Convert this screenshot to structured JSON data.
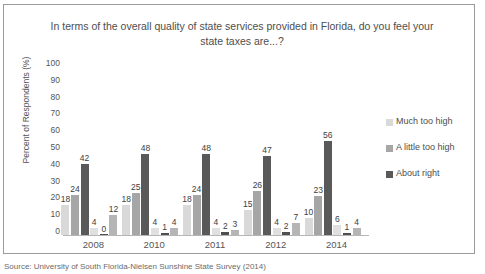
{
  "chart_data": {
    "type": "bar",
    "title": "In terms of the overall quality of state services provided in Florida, do you feel your state taxes are...?",
    "xlabel": "",
    "ylabel": "Percent of Respondents (%)",
    "ylim": [
      0,
      100
    ],
    "ytick_labels": [
      "100",
      "90",
      "80",
      "70",
      "60",
      "50",
      "40",
      "30",
      "20",
      "10",
      "0"
    ],
    "grid": false,
    "legend_position": "right",
    "categories": [
      "2008",
      "2010",
      "2011",
      "2012",
      "2014"
    ],
    "series": [
      {
        "name": "Much too high",
        "color": "#d9d9d9",
        "values": [
          18,
          18,
          18,
          15,
          10
        ]
      },
      {
        "name": "A little too high",
        "color": "#a6a6a6",
        "values": [
          24,
          25,
          24,
          26,
          23
        ]
      },
      {
        "name": "About right",
        "color": "#595959",
        "values": [
          42,
          48,
          48,
          47,
          56
        ]
      },
      {
        "name": "",
        "color": "#e0e0e0",
        "values": [
          4,
          4,
          4,
          4,
          6
        ]
      },
      {
        "name": "",
        "color": "#4f4f4f",
        "values": [
          0,
          1,
          2,
          2,
          1
        ]
      },
      {
        "name": "",
        "color": "#b5b5b5",
        "values": [
          12,
          4,
          3,
          7,
          4
        ]
      }
    ]
  },
  "legend": {
    "entries": [
      {
        "label": "Much too high",
        "color": "#d9d9d9"
      },
      {
        "label": "A little too high",
        "color": "#a6a6a6"
      },
      {
        "label": "About right",
        "color": "#595959"
      }
    ]
  },
  "footer": {
    "text": "Source: University of South Florida-Nielsen Sunshine State Survey (2014)"
  }
}
